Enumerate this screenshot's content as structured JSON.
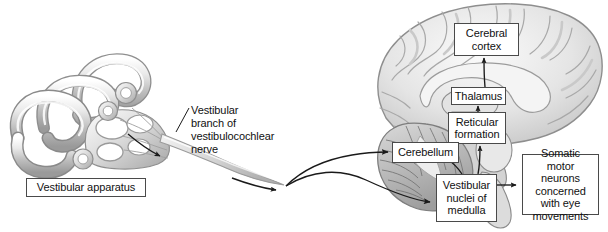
{
  "figure": {
    "background_color": "#ffffff",
    "line_color": "#1a1a1a",
    "box_border_color": "#4a4a4a",
    "text_color": "#111111",
    "width": 608,
    "height": 232
  },
  "labels": {
    "vestibular_apparatus": "Vestibular apparatus",
    "nerve_branch": "Vestibular\nbranch of\nvestibulocochlear\nnerve",
    "cerebral_cortex": "Cerebral\ncortex",
    "thalamus": "Thalamus",
    "reticular_formation": "Reticular\nformation",
    "cerebellum": "Cerebellum",
    "vestibular_nuclei": "Vestibular\nnuclei of\nmedulla",
    "somatic_motor_neurons": "Somatic\nmotor neurons\nconcerned\nwith eye\nmovements"
  },
  "illustrations": {
    "vestibular_apparatus_drawing": "inner-ear-semicircular-canals",
    "brain_drawing": "midsagittal-brain-section"
  },
  "connections": [
    {
      "name": "apparatus-to-nerve",
      "from": "vestibular apparatus",
      "to": "vestibular nerve",
      "style": "curved-arrow"
    },
    {
      "name": "nerve-to-cerebellum",
      "from": "vestibular nerve",
      "to": "Cerebellum",
      "style": "curved-arrow"
    },
    {
      "name": "nerve-to-vestibular-nuclei",
      "from": "vestibular nerve",
      "to": "Vestibular nuclei of medulla",
      "style": "curved-arrow"
    },
    {
      "name": "nuclei-to-reticular",
      "from": "Vestibular nuclei of medulla",
      "to": "Reticular formation",
      "style": "straight-arrow"
    },
    {
      "name": "nuclei-to-cerebellum",
      "from": "Vestibular nuclei of medulla",
      "to": "Cerebellum",
      "style": "straight-arrow"
    },
    {
      "name": "reticular-to-thalamus",
      "from": "Reticular formation",
      "to": "Thalamus",
      "style": "straight-arrow"
    },
    {
      "name": "thalamus-to-cortex",
      "from": "Thalamus",
      "to": "Cerebral cortex",
      "style": "straight-arrow"
    },
    {
      "name": "nuclei-to-somatic",
      "from": "Vestibular nuclei of medulla",
      "to": "Somatic motor neurons concerned with eye movements",
      "style": "straight-arrow"
    }
  ]
}
